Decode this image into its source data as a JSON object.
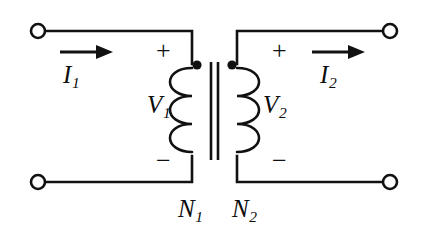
{
  "diagram": {
    "type": "electrical-schematic",
    "background_color": "#ffffff",
    "line_color": "#111111",
    "canvas": {
      "width": 424,
      "height": 231
    }
  },
  "labels": {
    "current_primary": {
      "symbol": "I",
      "subscript": "1",
      "text": "I"
    },
    "current_secondary": {
      "symbol": "I",
      "subscript": "2",
      "text": "I"
    },
    "voltage_primary": {
      "symbol": "V",
      "subscript": "1",
      "text": "V"
    },
    "voltage_secondary": {
      "symbol": "V",
      "subscript": "2",
      "text": "V"
    },
    "turns_primary": {
      "symbol": "N",
      "subscript": "1",
      "text": "N"
    },
    "turns_secondary": {
      "symbol": "N",
      "subscript": "2",
      "text": "N"
    },
    "polarity_plus_primary": "+",
    "polarity_minus_primary": "−",
    "polarity_plus_secondary": "+",
    "polarity_minus_secondary": "−"
  },
  "components": {
    "terminals": [
      {
        "name": "primary-top",
        "cx": 38,
        "cy": 31,
        "r": 7
      },
      {
        "name": "primary-bottom",
        "cx": 38,
        "cy": 182,
        "r": 7
      },
      {
        "name": "secondary-top",
        "cx": 390,
        "cy": 31,
        "r": 7
      },
      {
        "name": "secondary-bottom",
        "cx": 390,
        "cy": 182,
        "r": 7
      }
    ],
    "polarity_dots": [
      {
        "name": "primary-dot",
        "cx": 197,
        "cy": 65,
        "r": 4.5
      },
      {
        "name": "secondary-dot",
        "cx": 232,
        "cy": 65,
        "r": 4.5
      }
    ],
    "core_lines": [
      {
        "name": "core-line-left",
        "x": 211,
        "y1": 62,
        "y2": 160
      },
      {
        "name": "core-line-right",
        "x": 218,
        "y1": 62,
        "y2": 160
      }
    ],
    "coils": [
      {
        "name": "primary-winding",
        "side": "left",
        "turns": 3,
        "spine_x": 192,
        "top_y": 68,
        "bottom_y": 152
      },
      {
        "name": "secondary-winding",
        "side": "right",
        "turns": 3,
        "spine_x": 237,
        "top_y": 68,
        "bottom_y": 152
      }
    ],
    "arrows": [
      {
        "name": "primary-current-arrow",
        "x1": 60,
        "x2": 108,
        "y": 52,
        "direction": "right"
      },
      {
        "name": "secondary-current-arrow",
        "x1": 312,
        "x2": 362,
        "y": 52,
        "direction": "right"
      }
    ]
  }
}
